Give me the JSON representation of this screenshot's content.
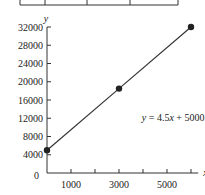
{
  "chart_data": {
    "type": "line",
    "title": "",
    "xlabel": "x",
    "ylabel": "y",
    "xlim": [
      0,
      6300
    ],
    "ylim": [
      0,
      32000
    ],
    "x_ticks": [
      1000,
      2000,
      3000,
      4000,
      5000,
      6000
    ],
    "x_tick_labels": [
      "1000",
      "",
      "3000",
      "",
      "5000",
      ""
    ],
    "y_ticks": [
      4000,
      8000,
      12000,
      16000,
      20000,
      24000,
      28000,
      32000
    ],
    "y_tick_labels": [
      "4000",
      "8000",
      "12000",
      "16000",
      "20000",
      "24000",
      "28000",
      "32000"
    ],
    "origin_label": "0",
    "grid": false,
    "series": [
      {
        "name": "y = 4.5x + 5000",
        "x": [
          0,
          3000,
          6000
        ],
        "y": [
          5000,
          18500,
          32000
        ],
        "markers": true
      }
    ],
    "annotations": [
      {
        "text": "y = 4.5x + 5000",
        "x": 4200,
        "y": 11500
      }
    ],
    "table_fragment": {
      "visible": true,
      "column_dividers": 4
    }
  },
  "labels": {
    "xlabel": "x",
    "ylabel": "y",
    "origin": "0",
    "equation": "y = 4.5x + 5000"
  }
}
